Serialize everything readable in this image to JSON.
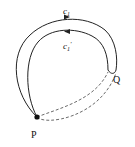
{
  "diagram": {
    "labels": {
      "c1": "c",
      "c1_sub": "1",
      "c1prime": "c",
      "c1prime_sub": "1",
      "c1prime_mark": "′",
      "P": "P",
      "Q": "Q"
    },
    "colors": {
      "stroke": "#222222",
      "background": "#ffffff"
    }
  }
}
